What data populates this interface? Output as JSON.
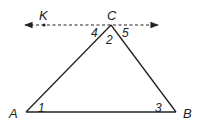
{
  "diagram": {
    "type": "geometry",
    "colors": {
      "stroke": "#222222",
      "background": "#ffffff"
    },
    "points": {
      "A": {
        "label": "A",
        "x": 26,
        "y": 112
      },
      "B": {
        "label": "B",
        "x": 176,
        "y": 112
      },
      "C": {
        "label": "C",
        "x": 111,
        "y": 25
      },
      "K": {
        "label": "K",
        "x": 44,
        "y": 25
      }
    },
    "line": {
      "style": "dashed",
      "through": [
        "K",
        "C"
      ],
      "arrows": "both",
      "x1": 25,
      "x2": 158,
      "y": 25
    },
    "angles": [
      {
        "label": "1",
        "vertex": "A"
      },
      {
        "label": "2",
        "vertex": "C"
      },
      {
        "label": "3",
        "vertex": "B"
      },
      {
        "label": "4",
        "vertex": "C"
      },
      {
        "label": "5",
        "vertex": "C"
      }
    ]
  }
}
